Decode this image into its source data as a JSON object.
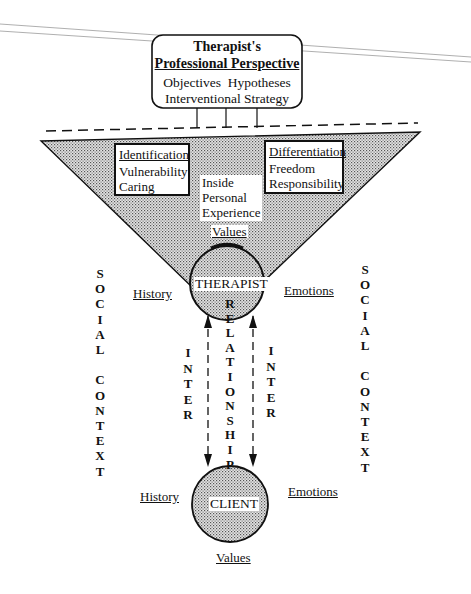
{
  "perspective_box": {
    "title_line1": "Therapist's",
    "title_line2": "Professional Perspective",
    "items_line1": "Objectives  Hypotheses",
    "items_line2": "Interventional Strategy"
  },
  "identification_box": {
    "heading": "Identification",
    "line1": "Vulnerability",
    "line2": "Caring"
  },
  "differentiation_box": {
    "heading": "Differentiation",
    "line1": "Freedom",
    "line2": "Responsibility"
  },
  "inside_experience": {
    "line1": "Inside",
    "line2": "Personal",
    "line3": "Experience"
  },
  "therapist": {
    "values": "Values",
    "label": "THERAPIST",
    "history": "History",
    "emotions": "Emotions"
  },
  "client": {
    "label": "CLIENT",
    "history": "History",
    "emotions": "Emotions",
    "values": "Values"
  },
  "relationship_letters": [
    "R",
    "E",
    "L",
    "A",
    "T",
    "I",
    "O",
    "N",
    "S",
    "H",
    "I",
    "P"
  ],
  "inter_left_letters": [
    "I",
    "N",
    "T",
    "E",
    "R"
  ],
  "inter_right_letters": [
    "I",
    "N",
    "T",
    "E",
    "R"
  ],
  "social_context_left": [
    "S",
    "O",
    "C",
    "I",
    "A",
    "L",
    "",
    "C",
    "O",
    "N",
    "T",
    "E",
    "X",
    "T"
  ],
  "social_context_right": [
    "S",
    "O",
    "C",
    "I",
    "A",
    "L",
    "",
    "C",
    "O",
    "N",
    "T",
    "E",
    "X",
    "T"
  ],
  "colors": {
    "shade": "#c8c8c8",
    "ink": "#111111"
  }
}
